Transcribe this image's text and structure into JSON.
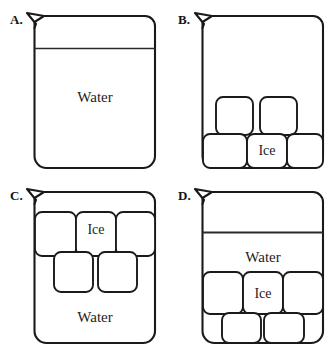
{
  "figure": {
    "title": "",
    "width": 334,
    "height": 351,
    "background_color": "#ffffff",
    "stroke_color": "#1a1a1a",
    "fill_color": "#ffffff"
  },
  "panels": [
    {
      "id": "A",
      "letter": "A.",
      "description": "Beaker filled with water to a high level, no ice",
      "water_line": true,
      "water_label": "Water",
      "ice_label": null,
      "ice_cubes": 0
    },
    {
      "id": "B",
      "letter": "B.",
      "description": "Beaker containing only ice cubes, no water line",
      "water_line": false,
      "water_label": null,
      "ice_label": "Ice",
      "ice_cubes": 5
    },
    {
      "id": "C",
      "letter": "C.",
      "description": "Beaker with ice cubes floating in upper portion above water",
      "water_line": false,
      "water_label": "Water",
      "ice_label": "Ice",
      "ice_cubes": 5
    },
    {
      "id": "D",
      "letter": "D.",
      "description": "Beaker with water line near top, water above ice cubes resting at bottom",
      "water_line": true,
      "water_label": "Water",
      "ice_label": "Ice",
      "ice_cubes": 5
    }
  ],
  "labels": {
    "water": "Water",
    "ice": "Ice"
  }
}
